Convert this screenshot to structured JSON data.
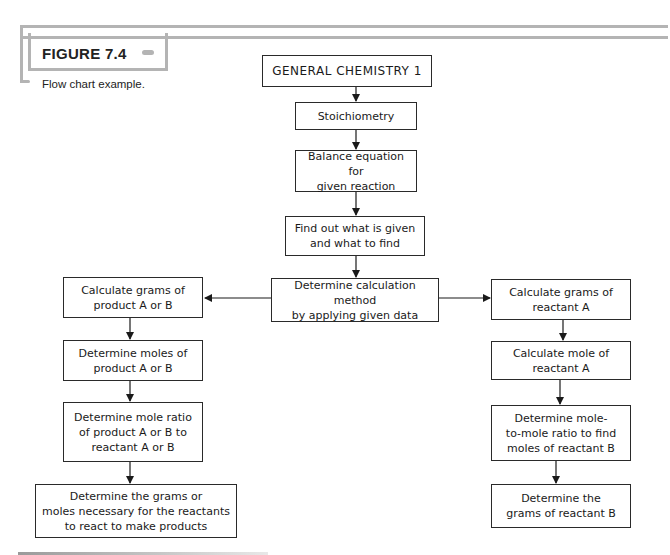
{
  "figure": {
    "label": "FIGURE 7.4",
    "caption": "Flow chart example."
  },
  "flowchart": {
    "root": "GENERAL CHEMISTRY 1",
    "main_steps": [
      "Stoichiometry",
      "Balance equation for\ngiven reaction",
      "Find out what is given\nand what to find",
      "Determine calculation method\nby applying given data"
    ],
    "left_branch": [
      "Calculate grams of\nproduct A or B",
      "Determine moles of\nproduct A or B",
      "Determine mole ratio\nof product A or B to\nreactant A or B",
      "Determine the grams or\nmoles necessary for the reactants\nto react to make products"
    ],
    "right_branch": [
      "Calculate grams of\nreactant A",
      "Calculate mole of\nreactant A",
      "Determine mole-\nto-mole ratio to find\nmoles of reactant B",
      "Determine the\ngrams of reactant B"
    ]
  },
  "colors": {
    "frame": "#b4b4b4",
    "stroke": "#2a2a2a"
  }
}
